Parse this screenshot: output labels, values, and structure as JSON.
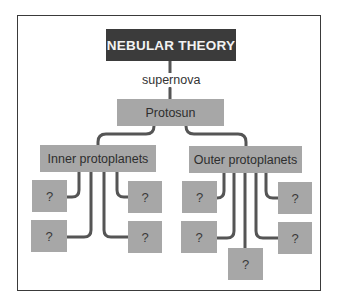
{
  "diagram": {
    "title": "NEBULAR THEORY",
    "edge_label": "supernova",
    "root_child": "Protosun",
    "branches": [
      {
        "label": "Inner protoplanets",
        "children": [
          "?",
          "?",
          "?",
          "?"
        ]
      },
      {
        "label": "Outer protoplanets",
        "children": [
          "?",
          "?",
          "?",
          "?",
          "?"
        ]
      }
    ],
    "colors": {
      "title_bg": "#3b3b3b",
      "box_bg": "#a7a7a7",
      "connector": "#555555",
      "frame": "#3a3a3a"
    }
  }
}
